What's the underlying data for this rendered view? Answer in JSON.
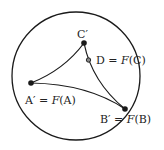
{
  "diagram": {
    "stroke_color": "#1a1a1a",
    "points": [
      {
        "id": "C",
        "label": "C′",
        "filled": true
      },
      {
        "id": "D",
        "label_lhs": "D",
        "label_eq": " = ",
        "label_fn": "F",
        "label_arg": "(C)",
        "filled": false
      },
      {
        "id": "A",
        "label_lhs": "A′",
        "label_eq": " = ",
        "label_fn": "F",
        "label_arg": "(A)",
        "filled": true
      },
      {
        "id": "B",
        "label_lhs": "B′",
        "label_eq": " = ",
        "label_fn": "F",
        "label_arg": "(B)",
        "filled": true
      }
    ]
  }
}
